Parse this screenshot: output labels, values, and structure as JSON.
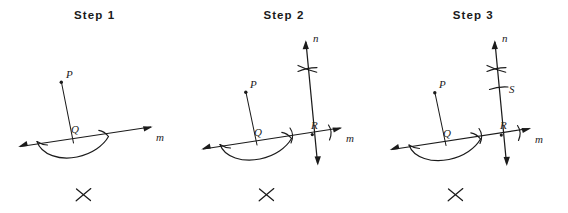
{
  "figure": {
    "background_color": "#ffffff",
    "ink_color": "#1b1b1b",
    "panel_count": 3
  },
  "panels": [
    {
      "id": "step-1",
      "title": "Step 1",
      "labels": {
        "point_p": "P",
        "point_q": "Q",
        "line_m": "m"
      },
      "mark_below": "✕",
      "elements": [
        "point P above line m",
        "segment from P to Q on line m",
        "line m with arrowheads both ends",
        "compass arc centered at Q crossing line m on both sides"
      ]
    },
    {
      "id": "step-2",
      "title": "Step 2",
      "labels": {
        "point_p": "P",
        "point_q": "Q",
        "point_r": "R",
        "line_m": "m",
        "line_n": "n"
      },
      "mark_below": "✕",
      "elements": [
        "point P above line m",
        "segment from P to Q on line m",
        "line m with arrowheads both ends",
        "compass arc centered at Q crossing line m",
        "line n perpendicular-ish through R with arrowheads both ends",
        "two intersecting arcs crossing line n above m",
        "two tick arcs on line m straddling R"
      ]
    },
    {
      "id": "step-3",
      "title": "Step 3",
      "labels": {
        "point_p": "P",
        "point_q": "Q",
        "point_r": "R",
        "point_s": "S",
        "line_m": "m",
        "line_n": "n"
      },
      "mark_below": "✕",
      "elements": [
        "point P above line m",
        "segment from P to Q on line m",
        "line m with arrowheads both ends",
        "compass arc centered at Q crossing line m",
        "line n through R with arrowheads both ends",
        "two intersecting arcs crossing line n above m",
        "tick arc marking point S on line n",
        "two tick arcs on line m straddling R"
      ]
    }
  ]
}
